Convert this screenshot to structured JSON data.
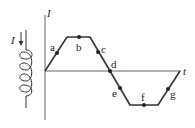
{
  "diagram": {
    "inductor": {
      "current_label": "I",
      "arrow_direction": "down"
    },
    "graph": {
      "y_axis_label": "I",
      "x_axis_label": "t",
      "waveform": "trapezoidal",
      "points": [
        {
          "label": "a",
          "segment": "rising"
        },
        {
          "label": "b",
          "segment": "positive-plateau"
        },
        {
          "label": "c",
          "segment": "falling"
        },
        {
          "label": "d",
          "segment": "zero-crossing"
        },
        {
          "label": "e",
          "segment": "falling"
        },
        {
          "label": "f",
          "segment": "negative-plateau"
        },
        {
          "label": "g",
          "segment": "rising"
        }
      ]
    },
    "colors": {
      "line": "#333333",
      "text": "#222222"
    }
  }
}
